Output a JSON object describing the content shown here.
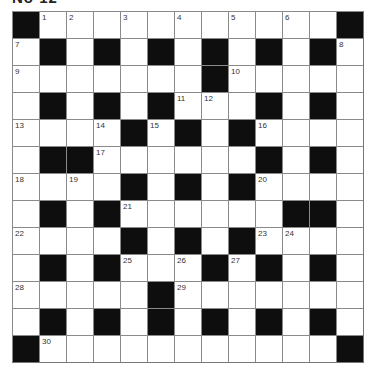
{
  "puzzle": {
    "title": "No 12",
    "rows": 13,
    "cols": 13,
    "colors": {
      "black": "#0e0e0e",
      "white": "#ffffff",
      "grid_line": "#8a8a8a"
    },
    "grid": [
      "#...........#",
      ".#.#.#.#.#.#.",
      ".......#.....",
      ".#.#.#...#.#.",
      "....#.#.#....",
      ".##......#.#.",
      "....#.#.#....",
      ".#.#......##.",
      "....#.#.#....",
      ".#.#...#.#.#.",
      ".....#.......",
      ".#.#.#.#.#.#.",
      "#...........#"
    ],
    "numbers": [
      {
        "r": 0,
        "c": 1,
        "n": "1"
      },
      {
        "r": 0,
        "c": 2,
        "n": "2"
      },
      {
        "r": 0,
        "c": 4,
        "n": "3"
      },
      {
        "r": 0,
        "c": 6,
        "n": "4"
      },
      {
        "r": 0,
        "c": 8,
        "n": "5"
      },
      {
        "r": 0,
        "c": 10,
        "n": "6"
      },
      {
        "r": 1,
        "c": 0,
        "n": "7"
      },
      {
        "r": 1,
        "c": 12,
        "n": "8"
      },
      {
        "r": 2,
        "c": 0,
        "n": "9"
      },
      {
        "r": 2,
        "c": 8,
        "n": "10"
      },
      {
        "r": 3,
        "c": 6,
        "n": "11"
      },
      {
        "r": 3,
        "c": 7,
        "n": "12"
      },
      {
        "r": 4,
        "c": 0,
        "n": "13"
      },
      {
        "r": 4,
        "c": 3,
        "n": "14"
      },
      {
        "r": 4,
        "c": 5,
        "n": "15"
      },
      {
        "r": 4,
        "c": 9,
        "n": "16"
      },
      {
        "r": 5,
        "c": 3,
        "n": "17"
      },
      {
        "r": 6,
        "c": 0,
        "n": "18"
      },
      {
        "r": 6,
        "c": 2,
        "n": "19"
      },
      {
        "r": 6,
        "c": 9,
        "n": "20"
      },
      {
        "r": 7,
        "c": 4,
        "n": "21"
      },
      {
        "r": 8,
        "c": 0,
        "n": "22"
      },
      {
        "r": 8,
        "c": 9,
        "n": "23"
      },
      {
        "r": 8,
        "c": 10,
        "n": "24"
      },
      {
        "r": 9,
        "c": 4,
        "n": "25"
      },
      {
        "r": 9,
        "c": 6,
        "n": "26"
      },
      {
        "r": 9,
        "c": 8,
        "n": "27"
      },
      {
        "r": 10,
        "c": 0,
        "n": "28"
      },
      {
        "r": 10,
        "c": 6,
        "n": "29"
      },
      {
        "r": 12,
        "c": 1,
        "n": "30"
      }
    ]
  }
}
